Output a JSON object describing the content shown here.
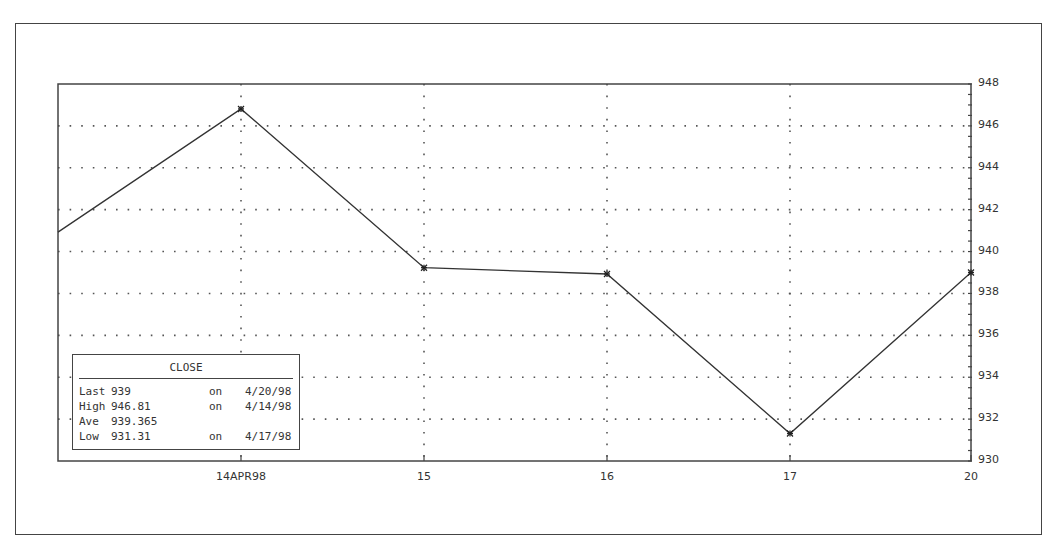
{
  "chart_data": {
    "type": "line",
    "title": "",
    "series": [
      {
        "name": "CLOSE",
        "values": [
          940.93,
          946.81,
          939.23,
          938.93,
          931.31,
          939.0
        ]
      }
    ],
    "x": [
      "13",
      "14APR98",
      "15",
      "16",
      "17",
      "20"
    ],
    "x_tick_labels": [
      "14APR98",
      "15",
      "16",
      "17",
      "20"
    ],
    "xlabel": "",
    "ylabel": "",
    "ylim": [
      930,
      948
    ],
    "y_tick_labels": [
      "948",
      "946",
      "944",
      "942",
      "940",
      "938",
      "936",
      "934",
      "932",
      "930"
    ],
    "y_axis_position": "right",
    "grid": true,
    "grid_style": "dotted",
    "marker": "asterisk",
    "legend": {
      "position": "lower-left",
      "title": "CLOSE",
      "rows": [
        {
          "label": "Last",
          "value": "939",
          "on": "on",
          "date": "4/20/98"
        },
        {
          "label": "High",
          "value": "946.81",
          "on": "on",
          "date": "4/14/98"
        },
        {
          "label": "Ave",
          "value": "939.365",
          "on": "",
          "date": ""
        },
        {
          "label": "Low",
          "value": "931.31",
          "on": "on",
          "date": "4/17/98"
        }
      ]
    }
  },
  "colors": {
    "line": "#333333",
    "frame": "#444444",
    "grid": "#555555",
    "background": "#ffffff"
  }
}
